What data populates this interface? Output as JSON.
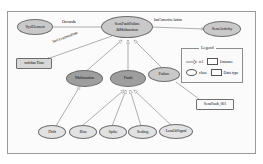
{
  "diagram": {
    "legend": {
      "caption": "Legend",
      "rows": [
        {
          "symbol": "arrow-icon",
          "label": "rel"
        },
        {
          "symbol": "rectangle-icon",
          "label": "Instance"
        },
        {
          "symbol": "ellipse-icon",
          "label": "class"
        },
        {
          "symbol": "rectangle-icon",
          "label": "Data type"
        }
      ]
    },
    "nodes": [
      {
        "id": "sysElement",
        "label": "SysElement",
        "shape": "ellipse",
        "fill": "mid"
      },
      {
        "id": "center",
        "label": "SensFaultFailure\n&Malfunction",
        "line1": "SensFaultFailure",
        "line2": "&Malfunction",
        "shape": "ellipse",
        "fill": "mid"
      },
      {
        "id": "sensActivity",
        "label": "SensActivity",
        "shape": "ellipse",
        "fill": "mid"
      },
      {
        "id": "dateTime",
        "label": "xsd:dateTime",
        "shape": "rect",
        "fill": "grey"
      },
      {
        "id": "malfunction",
        "label": "Malfunction",
        "shape": "ellipse",
        "fill": "dark"
      },
      {
        "id": "fault",
        "label": "Fault",
        "shape": "ellipse",
        "fill": "dark"
      },
      {
        "id": "failure",
        "label": "Failure",
        "shape": "ellipse",
        "fill": "mid"
      },
      {
        "id": "sensFault001",
        "label": "SensFault_001",
        "shape": "rect",
        "fill": "white"
      },
      {
        "id": "bias",
        "label": "Bias",
        "shape": "ellipse",
        "fill": "light"
      },
      {
        "id": "drift",
        "label": "Drift",
        "shape": "ellipse",
        "fill": "light"
      },
      {
        "id": "spike",
        "label": "Spike",
        "shape": "ellipse",
        "fill": "light"
      },
      {
        "id": "scaling",
        "label": "Scaling",
        "shape": "ellipse",
        "fill": "light"
      },
      {
        "id": "lossOfSignal",
        "label": "LossOfSignal",
        "shape": "ellipse",
        "fill": "light"
      }
    ],
    "edge_labels": [
      {
        "id": "occursIn",
        "text": "OccursIn"
      },
      {
        "id": "hasCorrectiveAction",
        "text": "hasCorrectiveAction"
      },
      {
        "id": "hasOccurrenceDate",
        "text": "hasOccurrenceDate"
      }
    ],
    "colors": {
      "node_stroke": "#6e6e6e",
      "fill_light": "#e2e2e2",
      "fill_mid": "#c9c9c9",
      "fill_dark": "#9e9e9e",
      "edge": "#7a7a7a",
      "frame": "#9a9a9a",
      "background": "#ffffff"
    }
  }
}
